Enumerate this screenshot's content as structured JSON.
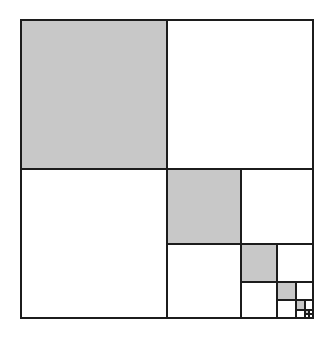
{
  "figure": {
    "canvas": {
      "width": 332,
      "height": 338,
      "background": "#ffffff"
    },
    "colors": {
      "fill_shaded": "#c8c8c8",
      "fill_empty": "#ffffff",
      "stroke": "#1c1c1c"
    },
    "geometry": {
      "origin_x": 20,
      "origin_y": 19,
      "size_w": 294,
      "size_h": 300,
      "split_ratio": 0.5,
      "depth": 6
    },
    "legend": {
      "shaded_label": "shaded quadrant",
      "empty_label": "empty quadrant",
      "recursive_label": "recursive quadrant"
    }
  },
  "chart_data": {
    "type": "diagram",
    "subtitle": "",
    "xlabel": "",
    "ylabel": "",
    "grid": false,
    "legend_position": "none",
    "pattern": {
      "rule": "Divide square into 4 equal quadrants. Shade the top-left quadrant. Leave the top-right and bottom-left quadrants empty. Recurse into the bottom-right quadrant.",
      "levels": 6,
      "shaded_area_fraction_per_level": 0.25,
      "cumulative_shaded_fraction": 0.333
    },
    "cells": [
      {
        "level": 1,
        "role": "shaded",
        "x": 0.0,
        "y": 0.0,
        "w": 0.5,
        "h": 0.5
      },
      {
        "level": 1,
        "role": "empty",
        "x": 0.5,
        "y": 0.0,
        "w": 0.5,
        "h": 0.5
      },
      {
        "level": 1,
        "role": "empty",
        "x": 0.0,
        "y": 0.5,
        "w": 0.5,
        "h": 0.5
      },
      {
        "level": 2,
        "role": "shaded",
        "x": 0.5,
        "y": 0.5,
        "w": 0.25,
        "h": 0.25
      },
      {
        "level": 2,
        "role": "empty",
        "x": 0.75,
        "y": 0.5,
        "w": 0.25,
        "h": 0.25
      },
      {
        "level": 2,
        "role": "empty",
        "x": 0.5,
        "y": 0.75,
        "w": 0.25,
        "h": 0.25
      },
      {
        "level": 3,
        "role": "shaded",
        "x": 0.75,
        "y": 0.75,
        "w": 0.125,
        "h": 0.125
      },
      {
        "level": 3,
        "role": "empty",
        "x": 0.875,
        "y": 0.75,
        "w": 0.125,
        "h": 0.125
      },
      {
        "level": 3,
        "role": "empty",
        "x": 0.75,
        "y": 0.875,
        "w": 0.125,
        "h": 0.125
      },
      {
        "level": 4,
        "role": "shaded",
        "x": 0.875,
        "y": 0.875,
        "w": 0.0625,
        "h": 0.0625
      },
      {
        "level": 4,
        "role": "empty",
        "x": 0.9375,
        "y": 0.875,
        "w": 0.0625,
        "h": 0.0625
      },
      {
        "level": 4,
        "role": "empty",
        "x": 0.875,
        "y": 0.9375,
        "w": 0.0625,
        "h": 0.0625
      },
      {
        "level": 5,
        "role": "shaded",
        "x": 0.9375,
        "y": 0.9375,
        "w": 0.03125,
        "h": 0.03125
      },
      {
        "level": 5,
        "role": "empty",
        "x": 0.96875,
        "y": 0.9375,
        "w": 0.03125,
        "h": 0.03125
      },
      {
        "level": 5,
        "role": "empty",
        "x": 0.9375,
        "y": 0.96875,
        "w": 0.03125,
        "h": 0.03125
      },
      {
        "level": 6,
        "role": "shaded",
        "x": 0.96875,
        "y": 0.96875,
        "w": 0.015625,
        "h": 0.015625
      },
      {
        "level": 6,
        "role": "empty",
        "x": 0.984375,
        "y": 0.96875,
        "w": 0.015625,
        "h": 0.015625
      },
      {
        "level": 6,
        "role": "empty",
        "x": 0.96875,
        "y": 0.984375,
        "w": 0.015625,
        "h": 0.015625
      },
      {
        "level": 6,
        "role": "empty",
        "x": 0.984375,
        "y": 0.984375,
        "w": 0.015625,
        "h": 0.015625
      }
    ]
  }
}
